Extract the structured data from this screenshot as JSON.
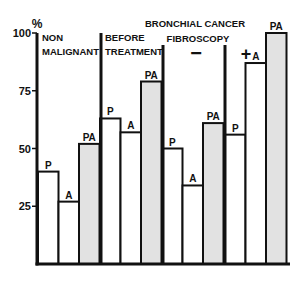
{
  "chart_data": {
    "type": "bar",
    "title": "BRONCHIAL CANCER",
    "ylabel": "%",
    "xlabel": "",
    "ylim": [
      0,
      100
    ],
    "yticks": [
      25,
      50,
      75,
      100
    ],
    "grid": false,
    "groups": [
      {
        "label": "NON MALIGNANT",
        "label_lines": [
          "NON",
          "MALIGNANT"
        ]
      },
      {
        "label": "BEFORE TREATMENT",
        "label_lines": [
          "BEFORE",
          "TREATMENT"
        ]
      },
      {
        "label": "FIBROSCOPY −",
        "label_lines": [
          "−"
        ]
      },
      {
        "label": "FIBROSCOPY +",
        "label_lines": [
          "+"
        ]
      }
    ],
    "annotations": [
      "FIBROSCOPY"
    ],
    "categories": [
      "P",
      "A",
      "PA"
    ],
    "series": [
      {
        "name": "NON MALIGNANT",
        "values": [
          40,
          27,
          52
        ]
      },
      {
        "name": "BEFORE TREATMENT",
        "values": [
          63,
          57,
          79
        ]
      },
      {
        "name": "FIBROSCOPY −",
        "values": [
          50,
          34,
          61
        ]
      },
      {
        "name": "FIBROSCOPY +",
        "values": [
          56,
          87,
          100
        ]
      }
    ],
    "colors": {
      "P": "#ffffff",
      "A": "#ffffff",
      "PA": "#e2e2e2",
      "stroke": "#111111"
    }
  }
}
